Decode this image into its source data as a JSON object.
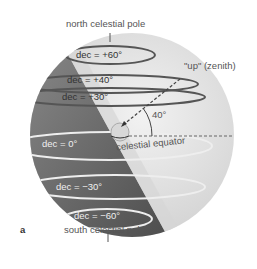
{
  "labels": {
    "north_pole": "north celestial pole",
    "south_pole": "south celestial pole",
    "zenith": "\"up\" (zenith)",
    "angle": "40°",
    "equator": "celestial equator",
    "panel": "a"
  },
  "declinations": [
    {
      "label": "dec = +60°",
      "value": 60
    },
    {
      "label": "dec = +40°",
      "value": 40
    },
    {
      "label": "dec = +30°",
      "value": 30
    },
    {
      "label": "dec = 0°",
      "value": 0
    },
    {
      "label": "dec = −30°",
      "value": -30
    },
    {
      "label": "dec = −60°",
      "value": -60
    }
  ],
  "colors": {
    "sphere_light": "#e4e4e4",
    "sphere_dark": "#6a6a6a",
    "circle_stroke": "#555555",
    "text": "#555555"
  }
}
